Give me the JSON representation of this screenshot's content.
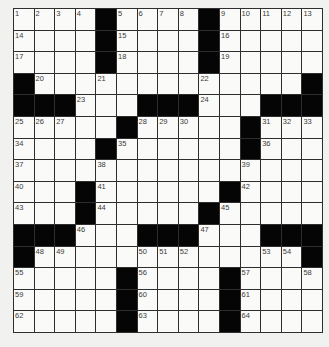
{
  "puzzle": {
    "rows": 15,
    "cols": 15,
    "layout": [
      "....#....#.....",
      "....#....#.....",
      "....#....#.....",
      "#.............#",
      "###...###...###",
      ".....#.....#...",
      "....#......#...",
      "...............",
      "...#......#....",
      "...#.....#.....",
      "###...###...###",
      "#.............#",
      ".....#....#....",
      ".....#....#....",
      ".....#....#...."
    ],
    "numbers": [
      {
        "r": 0,
        "c": 0,
        "n": "1"
      },
      {
        "r": 0,
        "c": 1,
        "n": "2"
      },
      {
        "r": 0,
        "c": 2,
        "n": "3"
      },
      {
        "r": 0,
        "c": 3,
        "n": "4"
      },
      {
        "r": 0,
        "c": 5,
        "n": "5"
      },
      {
        "r": 0,
        "c": 6,
        "n": "6"
      },
      {
        "r": 0,
        "c": 7,
        "n": "7"
      },
      {
        "r": 0,
        "c": 8,
        "n": "8"
      },
      {
        "r": 0,
        "c": 10,
        "n": "9"
      },
      {
        "r": 0,
        "c": 11,
        "n": "10"
      },
      {
        "r": 0,
        "c": 12,
        "n": "11"
      },
      {
        "r": 0,
        "c": 13,
        "n": "12"
      },
      {
        "r": 0,
        "c": 14,
        "n": "13"
      },
      {
        "r": 1,
        "c": 0,
        "n": "14"
      },
      {
        "r": 1,
        "c": 5,
        "n": "15"
      },
      {
        "r": 1,
        "c": 10,
        "n": "16"
      },
      {
        "r": 2,
        "c": 0,
        "n": "17"
      },
      {
        "r": 2,
        "c": 5,
        "n": "18"
      },
      {
        "r": 2,
        "c": 10,
        "n": "19"
      },
      {
        "r": 3,
        "c": 1,
        "n": "20"
      },
      {
        "r": 3,
        "c": 4,
        "n": "21"
      },
      {
        "r": 3,
        "c": 9,
        "n": "22"
      },
      {
        "r": 4,
        "c": 3,
        "n": "23"
      },
      {
        "r": 4,
        "c": 9,
        "n": "24"
      },
      {
        "r": 5,
        "c": 0,
        "n": "25"
      },
      {
        "r": 5,
        "c": 1,
        "n": "26"
      },
      {
        "r": 5,
        "c": 2,
        "n": "27"
      },
      {
        "r": 5,
        "c": 6,
        "n": "28"
      },
      {
        "r": 5,
        "c": 7,
        "n": "29"
      },
      {
        "r": 5,
        "c": 8,
        "n": "30"
      },
      {
        "r": 5,
        "c": 12,
        "n": "31"
      },
      {
        "r": 5,
        "c": 13,
        "n": "32"
      },
      {
        "r": 5,
        "c": 14,
        "n": "33"
      },
      {
        "r": 6,
        "c": 0,
        "n": "34"
      },
      {
        "r": 6,
        "c": 5,
        "n": "35"
      },
      {
        "r": 6,
        "c": 12,
        "n": "36"
      },
      {
        "r": 7,
        "c": 0,
        "n": "37"
      },
      {
        "r": 7,
        "c": 4,
        "n": "38"
      },
      {
        "r": 7,
        "c": 11,
        "n": "39"
      },
      {
        "r": 8,
        "c": 0,
        "n": "40"
      },
      {
        "r": 8,
        "c": 4,
        "n": "41"
      },
      {
        "r": 8,
        "c": 11,
        "n": "42"
      },
      {
        "r": 9,
        "c": 0,
        "n": "43"
      },
      {
        "r": 9,
        "c": 4,
        "n": "44"
      },
      {
        "r": 9,
        "c": 10,
        "n": "45"
      },
      {
        "r": 10,
        "c": 3,
        "n": "46"
      },
      {
        "r": 10,
        "c": 9,
        "n": "47"
      },
      {
        "r": 11,
        "c": 1,
        "n": "48"
      },
      {
        "r": 11,
        "c": 2,
        "n": "49"
      },
      {
        "r": 11,
        "c": 6,
        "n": "50"
      },
      {
        "r": 11,
        "c": 7,
        "n": "51"
      },
      {
        "r": 11,
        "c": 8,
        "n": "52"
      },
      {
        "r": 11,
        "c": 12,
        "n": "53"
      },
      {
        "r": 11,
        "c": 13,
        "n": "54"
      },
      {
        "r": 12,
        "c": 0,
        "n": "55"
      },
      {
        "r": 12,
        "c": 6,
        "n": "56"
      },
      {
        "r": 12,
        "c": 11,
        "n": "57"
      },
      {
        "r": 12,
        "c": 14,
        "n": "58"
      },
      {
        "r": 13,
        "c": 0,
        "n": "59"
      },
      {
        "r": 13,
        "c": 6,
        "n": "60"
      },
      {
        "r": 13,
        "c": 11,
        "n": "61"
      },
      {
        "r": 14,
        "c": 0,
        "n": "62"
      },
      {
        "r": 14,
        "c": 6,
        "n": "63"
      },
      {
        "r": 14,
        "c": 11,
        "n": "64"
      }
    ]
  },
  "colors": {
    "background": "#f1f1f0",
    "cell_white": "#fafaf9",
    "cell_black": "#050505",
    "grid_line": "#2e2e2e",
    "number_text": "#3a3a3a"
  }
}
